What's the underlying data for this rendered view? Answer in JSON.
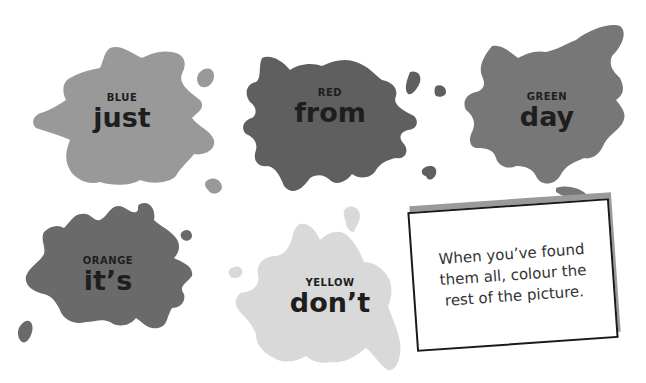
{
  "splats": [
    {
      "color_name": "BLUE",
      "word": "just",
      "fill": "#999999"
    },
    {
      "color_name": "RED",
      "word": "from",
      "fill": "#5f5f5f"
    },
    {
      "color_name": "GREEN",
      "word": "day",
      "fill": "#777777"
    },
    {
      "color_name": "ORANGE",
      "word": "it’s",
      "fill": "#6a6a6a"
    },
    {
      "color_name": "YELLOW",
      "word": "don’t",
      "fill": "#d9d9d9"
    }
  ],
  "note": {
    "text": "When you’ve found them all, colour the rest of the picture.",
    "border_color": "#1a1a1a",
    "shadow_color": "#9a9a9a"
  }
}
